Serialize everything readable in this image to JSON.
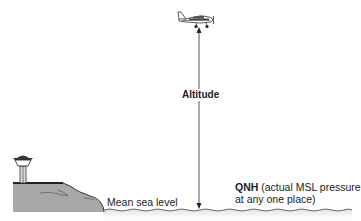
{
  "diagram": {
    "labels": {
      "altitude": "Altitude",
      "mean_sea_level": "Mean sea level",
      "qnh_bold": "QNH",
      "qnh_line1_rest": " (actual MSL pressure",
      "qnh_line2": "at any one place)"
    },
    "elements": {
      "aircraft": "light-aircraft-icon",
      "tower": "control-tower-icon",
      "terrain": "coastal-terrain",
      "sea": "sea-surface-wave-line",
      "arrow": "double-headed-altitude-arrow"
    },
    "colors": {
      "line": "#333333",
      "terrain_fill": "#a9a9a9",
      "terrain_edge": "#3a3a3a",
      "sea_shadow": "#e6e6e6"
    }
  }
}
